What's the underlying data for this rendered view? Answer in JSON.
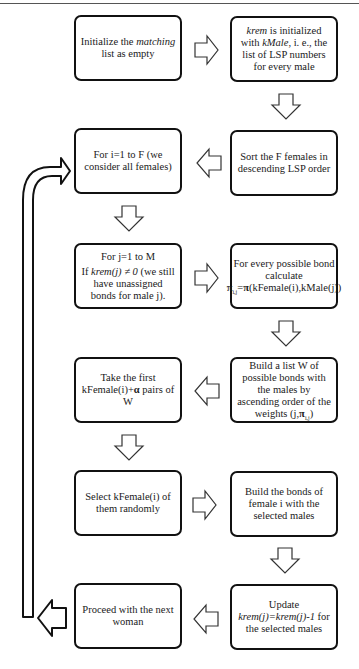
{
  "diagram": {
    "type": "flowchart",
    "boxes": [
      {
        "id": "init-matching",
        "parts": [
          "Initialize the ",
          "matching",
          " list as empty"
        ]
      },
      {
        "id": "init-krem",
        "parts": [
          "krem",
          " is initialized with ",
          "kMale",
          ", i. e., the list of LSP numbers for every male"
        ]
      },
      {
        "id": "sort-females",
        "text": "Sort the F females in descending LSP order"
      },
      {
        "id": "loop-females",
        "text": "For i=1 to F (we consider all females)"
      },
      {
        "id": "loop-males",
        "line1": "For j=1 to M",
        "parts": [
          "If ",
          "krem(j) ≠ 0",
          " (we still have unassigned bonds for male j)."
        ]
      },
      {
        "id": "calc-weights",
        "parts": [
          "For every possible bond calculate ",
          "π",
          "i,j",
          "=",
          "π",
          "(kFemale(i),kMale(j))"
        ]
      },
      {
        "id": "build-list-w",
        "parts": [
          "Build a list W of possible bonds with the males by ascending order of the weights (j,",
          "π",
          "i,j",
          ")"
        ]
      },
      {
        "id": "take-first",
        "parts": [
          "Take the first kFemale(i)+",
          "α",
          " pairs of W"
        ]
      },
      {
        "id": "select-random",
        "text": "Select kFemale(i) of them randomly"
      },
      {
        "id": "build-bonds",
        "text": "Build the bonds of female i with the selected males"
      },
      {
        "id": "update-krem",
        "line1": "Update",
        "parts": [
          "krem(j)=krem(j)-1",
          " for the selected males"
        ]
      },
      {
        "id": "next-woman",
        "text": "Proceed with the next woman"
      }
    ],
    "edges": [
      {
        "from": "init-matching",
        "to": "init-krem",
        "direction": "right"
      },
      {
        "from": "init-krem",
        "to": "sort-females",
        "direction": "down"
      },
      {
        "from": "sort-females",
        "to": "loop-females",
        "direction": "left"
      },
      {
        "from": "loop-females",
        "to": "loop-males",
        "direction": "down"
      },
      {
        "from": "loop-males",
        "to": "calc-weights",
        "direction": "right"
      },
      {
        "from": "calc-weights",
        "to": "build-list-w",
        "direction": "down"
      },
      {
        "from": "build-list-w",
        "to": "take-first",
        "direction": "left"
      },
      {
        "from": "take-first",
        "to": "select-random",
        "direction": "down"
      },
      {
        "from": "select-random",
        "to": "build-bonds",
        "direction": "right"
      },
      {
        "from": "build-bonds",
        "to": "update-krem",
        "direction": "down"
      },
      {
        "from": "update-krem",
        "to": "next-woman",
        "direction": "left"
      },
      {
        "from": "next-woman",
        "to": "loop-females",
        "direction": "loop-back"
      }
    ],
    "colors": {
      "stroke": "#111111",
      "fill": "#ffffff",
      "text": "#1a1a1a"
    }
  }
}
